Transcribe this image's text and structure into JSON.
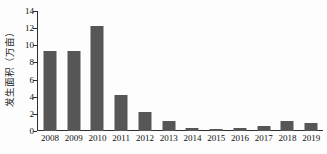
{
  "chart_data": {
    "type": "bar",
    "title": "",
    "xlabel": "",
    "ylabel": "发生面积（万亩）",
    "categories": [
      "2008",
      "2009",
      "2010",
      "2011",
      "2012",
      "2013",
      "2014",
      "2015",
      "2016",
      "2017",
      "2018",
      "2019"
    ],
    "values": [
      9.3,
      9.3,
      12.3,
      4.2,
      2.2,
      1.15,
      0.3,
      0.25,
      0.3,
      0.6,
      1.15,
      0.95
    ],
    "series": [
      {
        "name": "发生面积",
        "values": [
          9.3,
          9.3,
          12.3,
          4.2,
          2.2,
          1.15,
          0.3,
          0.25,
          0.3,
          0.6,
          1.15,
          0.95
        ]
      }
    ],
    "ylim": [
      0,
      14
    ],
    "yticks": [
      0,
      2,
      4,
      6,
      8,
      10,
      12,
      14
    ],
    "ytick_labels": [
      "0",
      "2",
      "4",
      "6",
      "8",
      "10",
      "12",
      "14"
    ],
    "grid": false,
    "legend": "none",
    "bar_color": "#565656",
    "axis_color": "#2e2e2e",
    "background_color": "#ffffff"
  }
}
